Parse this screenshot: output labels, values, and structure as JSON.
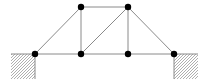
{
  "diagram": {
    "type": "truss",
    "joints": [
      {
        "id": "A",
        "role": "left-support"
      },
      {
        "id": "B",
        "role": "bottom"
      },
      {
        "id": "C",
        "role": "bottom"
      },
      {
        "id": "D",
        "role": "right-support"
      },
      {
        "id": "E",
        "role": "top"
      },
      {
        "id": "F",
        "role": "top"
      }
    ],
    "members": [
      [
        "A",
        "B"
      ],
      [
        "B",
        "C"
      ],
      [
        "C",
        "D"
      ],
      [
        "E",
        "F"
      ],
      [
        "A",
        "E"
      ],
      [
        "B",
        "E"
      ],
      [
        "B",
        "F"
      ],
      [
        "C",
        "F"
      ],
      [
        "F",
        "D"
      ]
    ],
    "supports": [
      {
        "joint": "A",
        "side": "left",
        "style": "hatched"
      },
      {
        "joint": "D",
        "side": "right",
        "style": "hatched"
      }
    ],
    "colors": {
      "member": "#8a8a8a",
      "joint": "#000000",
      "hatch": "#9a9a9a"
    }
  }
}
